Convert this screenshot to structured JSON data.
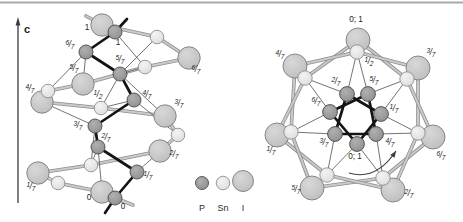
{
  "canvas": {
    "w": 463,
    "h": 222
  },
  "top_rule": {
    "y": 2.5,
    "color": "#a9a9a9",
    "width": 1.8
  },
  "axis": {
    "label": "c",
    "x": 18,
    "y_top": 24,
    "y_bottom": 203,
    "label_x": 24,
    "label_y": 33,
    "color": "#3a3a3a"
  },
  "atom_types": {
    "P": {
      "fill_light": "#b0b0b0",
      "fill_base": "#8e8e8e",
      "stroke": "#4a4a4a"
    },
    "Sn": {
      "fill_light": "#f3f3f3",
      "fill_base": "#dcdcdc",
      "stroke": "#8f8f8f"
    },
    "I": {
      "fill_light": "#d8d8d8",
      "fill_base": "#bdbdbd",
      "stroke": "#7d7d7d"
    }
  },
  "bond_styles": {
    "chain": {
      "under": "#8f8f8f",
      "under_w": 3.6,
      "over": "#cacaca",
      "over_w": 2.0
    },
    "thin": {
      "color": "#636363",
      "w": 0.9
    },
    "helix": {
      "color": "#141414",
      "w": 2.7
    }
  },
  "legend": {
    "label_y": 210.5,
    "entries": [
      {
        "type": "P",
        "label": "P",
        "x": 202,
        "y": 183,
        "r": 6.5
      },
      {
        "type": "Sn",
        "label": "Sn",
        "x": 223,
        "y": 183,
        "r": 6.8
      },
      {
        "type": "I",
        "label": "I",
        "x": 243,
        "y": 181,
        "r": 10.5
      }
    ]
  },
  "structures": [
    {
      "id": "helix-side-view",
      "atom_r": {
        "P": 7.0,
        "Sn": 6.8,
        "I": 11.2
      },
      "atoms": [
        {
          "id": "I1",
          "type": "I",
          "x": 102,
          "y": 25,
          "label": "1",
          "lx": 87,
          "ly": 30
        },
        {
          "id": "I67",
          "type": "I",
          "x": 189,
          "y": 58,
          "label": "6/7",
          "lx": 196,
          "ly": 72
        },
        {
          "id": "I57",
          "type": "I",
          "x": 83,
          "y": 84,
          "label": "5/7",
          "lx": 74,
          "ly": 71
        },
        {
          "id": "I47",
          "type": "I",
          "x": 42,
          "y": 102,
          "label": "4/7",
          "lx": 30,
          "ly": 91
        },
        {
          "id": "I37",
          "type": "I",
          "x": 165,
          "y": 116,
          "label": "3/7",
          "lx": 179,
          "ly": 106
        },
        {
          "id": "I27",
          "type": "I",
          "x": 160,
          "y": 151,
          "label": "2/7",
          "lx": 174,
          "ly": 157
        },
        {
          "id": "I17",
          "type": "I",
          "x": 38,
          "y": 173,
          "label": "1/7",
          "lx": 31,
          "ly": 189
        },
        {
          "id": "I0",
          "type": "I",
          "x": 102,
          "y": 192,
          "label": "0",
          "lx": 89,
          "ly": 200
        },
        {
          "id": "Sa",
          "type": "Sn",
          "x": 157,
          "y": 37
        },
        {
          "id": "Sb",
          "type": "Sn",
          "x": 145,
          "y": 67
        },
        {
          "id": "Sc",
          "type": "Sn",
          "x": 48,
          "y": 91
        },
        {
          "id": "Sh",
          "type": "Sn",
          "x": 101,
          "y": 108,
          "label": "1/2",
          "lx": 98,
          "ly": 97
        },
        {
          "id": "Sd",
          "type": "Sn",
          "x": 178,
          "y": 135
        },
        {
          "id": "Se",
          "type": "Sn",
          "x": 91,
          "y": 165
        },
        {
          "id": "Sf",
          "type": "Sn",
          "x": 58,
          "y": 183
        },
        {
          "id": "P1",
          "type": "P",
          "x": 115,
          "y": 32,
          "label": "1",
          "lx": 118,
          "ly": 45
        },
        {
          "id": "P67",
          "type": "P",
          "x": 86,
          "y": 52,
          "label": "6/7",
          "lx": 70,
          "ly": 47
        },
        {
          "id": "P57",
          "type": "P",
          "x": 120,
          "y": 74,
          "label": "5/7",
          "lx": 120,
          "ly": 62
        },
        {
          "id": "P47",
          "type": "P",
          "x": 134,
          "y": 100,
          "label": "4/7",
          "lx": 147,
          "ly": 97
        },
        {
          "id": "P37",
          "type": "P",
          "x": 95,
          "y": 126,
          "label": "3/7",
          "lx": 78,
          "ly": 128
        },
        {
          "id": "P27",
          "type": "P",
          "x": 98,
          "y": 147,
          "label": "2/7",
          "lx": 106,
          "ly": 140
        },
        {
          "id": "P17",
          "type": "P",
          "x": 137,
          "y": 172,
          "label": "1/7",
          "lx": 148,
          "ly": 178
        },
        {
          "id": "P0",
          "type": "P",
          "x": 115,
          "y": 198,
          "label": "0",
          "lx": 123,
          "ly": 209
        }
      ],
      "bonds": [
        {
          "kind": "chain",
          "a": "I1",
          "b": "Sa"
        },
        {
          "kind": "chain",
          "a": "Sa",
          "b": "I67"
        },
        {
          "kind": "chain",
          "a": "I67",
          "b": "Sb"
        },
        {
          "kind": "chain",
          "a": "Sb",
          "b": "I57"
        },
        {
          "kind": "chain",
          "a": "I57",
          "b": "Sc"
        },
        {
          "kind": "chain",
          "a": "Sc",
          "b": "I47"
        },
        {
          "kind": "chain",
          "a": "I47",
          "b": "Sh"
        },
        {
          "kind": "chain",
          "a": "Sh",
          "b": "I37"
        },
        {
          "kind": "chain",
          "a": "I37",
          "b": "Sd"
        },
        {
          "kind": "chain",
          "a": "Sd",
          "b": "I27"
        },
        {
          "kind": "chain",
          "a": "I27",
          "b": "Se"
        },
        {
          "kind": "chain",
          "a": "Se",
          "b": "I17"
        },
        {
          "kind": "chain",
          "a": "I17",
          "b": "Sf"
        },
        {
          "kind": "chain",
          "a": "Sf",
          "b": "I0"
        },
        {
          "kind": "thin",
          "a": "P1",
          "b": "Sb"
        },
        {
          "kind": "thin",
          "a": "Sa",
          "b": "P57"
        },
        {
          "kind": "thin",
          "a": "P67",
          "b": "Sc"
        },
        {
          "kind": "thin",
          "a": "P67",
          "b": "I57"
        },
        {
          "kind": "thin",
          "a": "P57",
          "b": "Sb"
        },
        {
          "kind": "thin",
          "a": "P57",
          "b": "Sh"
        },
        {
          "kind": "thin",
          "a": "P57",
          "b": "I37"
        },
        {
          "kind": "thin",
          "a": "P47",
          "b": "Sh"
        },
        {
          "kind": "thin",
          "a": "P47",
          "b": "Sd"
        },
        {
          "kind": "thin",
          "a": "P37",
          "b": "I47"
        },
        {
          "kind": "thin",
          "a": "P37",
          "b": "Se"
        },
        {
          "kind": "thin",
          "a": "P27",
          "b": "Se"
        },
        {
          "kind": "thin",
          "a": "P27",
          "b": "I0"
        },
        {
          "kind": "thin",
          "a": "P17",
          "b": "I27"
        },
        {
          "kind": "helix",
          "a": "P1",
          "b": "P67"
        },
        {
          "kind": "helix",
          "a": "P67",
          "b": "P57"
        },
        {
          "kind": "helix",
          "a": "P57",
          "b": "P47"
        },
        {
          "kind": "helix",
          "a": "P47",
          "b": "P37"
        },
        {
          "kind": "helix",
          "a": "P37",
          "b": "P27"
        },
        {
          "kind": "helix",
          "a": "P27",
          "b": "P17"
        },
        {
          "kind": "helix",
          "a": "P17",
          "b": "P0"
        }
      ],
      "stubs": [
        {
          "kind": "helix",
          "x1": 115,
          "y1": 32,
          "x2": 127,
          "y2": 19
        },
        {
          "kind": "helix",
          "x1": 115,
          "y1": 198,
          "x2": 105,
          "y2": 213
        },
        {
          "kind": "chain",
          "x1": 102,
          "y1": 25,
          "x2": 86,
          "y2": 16
        },
        {
          "kind": "chain",
          "x1": 115,
          "y1": 198,
          "x2": 133,
          "y2": 205
        }
      ]
    },
    {
      "id": "helix-projection",
      "atom_r": {
        "P": 7.4,
        "Sn": 7.2,
        "I": 12.0
      },
      "atoms": [
        {
          "id": "I01",
          "type": "I",
          "x": 358,
          "y": 40,
          "label": "0; 1",
          "lx": 356,
          "ly": 22
        },
        {
          "id": "I47",
          "type": "I",
          "x": 295,
          "y": 66,
          "label": "4/7",
          "lx": 280,
          "ly": 57
        },
        {
          "id": "I37",
          "type": "I",
          "x": 418,
          "y": 68,
          "label": "3/7",
          "lx": 431,
          "ly": 55
        },
        {
          "id": "I17",
          "type": "I",
          "x": 277,
          "y": 135,
          "label": "1/7",
          "lx": 271,
          "ly": 153
        },
        {
          "id": "I67",
          "type": "I",
          "x": 433,
          "y": 137,
          "label": "6/7",
          "lx": 441,
          "ly": 158
        },
        {
          "id": "I57",
          "type": "I",
          "x": 312,
          "y": 188,
          "label": "5/7",
          "lx": 296,
          "ly": 192
        },
        {
          "id": "I27",
          "type": "I",
          "x": 393,
          "y": 190,
          "label": "2/7",
          "lx": 409,
          "ly": 196
        },
        {
          "id": "S12",
          "type": "Sn",
          "x": 357,
          "y": 52,
          "label": "1/2",
          "lx": 369,
          "ly": 64
        },
        {
          "id": "Sul",
          "type": "Sn",
          "x": 305,
          "y": 78
        },
        {
          "id": "Sur",
          "type": "Sn",
          "x": 407,
          "y": 79
        },
        {
          "id": "Sl",
          "type": "Sn",
          "x": 291,
          "y": 132
        },
        {
          "id": "Sr",
          "type": "Sn",
          "x": 418,
          "y": 133
        },
        {
          "id": "Sbl",
          "type": "Sn",
          "x": 327,
          "y": 175
        },
        {
          "id": "Sbr",
          "type": "Sn",
          "x": 383,
          "y": 178
        },
        {
          "id": "P27",
          "type": "P",
          "x": 347,
          "y": 94,
          "label": "2/7",
          "lx": 336,
          "ly": 84
        },
        {
          "id": "P57",
          "type": "P",
          "x": 368,
          "y": 94,
          "label": "5/7",
          "lx": 374,
          "ly": 83
        },
        {
          "id": "P67",
          "type": "P",
          "x": 330,
          "y": 112,
          "label": "6/7",
          "lx": 316,
          "ly": 104
        },
        {
          "id": "P17",
          "type": "P",
          "x": 381,
          "y": 114,
          "label": "1/7",
          "lx": 394,
          "ly": 111
        },
        {
          "id": "P37",
          "type": "P",
          "x": 335,
          "y": 134,
          "label": "3/7",
          "lx": 324,
          "ly": 145
        },
        {
          "id": "P47",
          "type": "P",
          "x": 376,
          "y": 134,
          "label": "4/7",
          "lx": 390,
          "ly": 145
        },
        {
          "id": "P01",
          "type": "P",
          "x": 357,
          "y": 144,
          "label": "0; 1",
          "lx": 355,
          "ly": 159
        }
      ],
      "bonds": [
        {
          "kind": "chain",
          "a": "I01",
          "b": "Sul"
        },
        {
          "kind": "chain",
          "a": "I01",
          "b": "Sur"
        },
        {
          "kind": "chain",
          "a": "S12",
          "b": "I47"
        },
        {
          "kind": "chain",
          "a": "S12",
          "b": "I37"
        },
        {
          "kind": "chain",
          "a": "I47",
          "b": "Sl"
        },
        {
          "kind": "chain",
          "a": "Sul",
          "b": "I17"
        },
        {
          "kind": "chain",
          "a": "I37",
          "b": "Sr"
        },
        {
          "kind": "chain",
          "a": "Sur",
          "b": "I67"
        },
        {
          "kind": "chain",
          "a": "I17",
          "b": "Sbl"
        },
        {
          "kind": "chain",
          "a": "Sl",
          "b": "I57"
        },
        {
          "kind": "chain",
          "a": "I67",
          "b": "Sbr"
        },
        {
          "kind": "chain",
          "a": "Sr",
          "b": "I27"
        },
        {
          "kind": "chain",
          "a": "I57",
          "b": "Sbr"
        },
        {
          "kind": "chain",
          "a": "Sbl",
          "b": "I27"
        },
        {
          "kind": "thin",
          "a": "S12",
          "b": "P27"
        },
        {
          "kind": "thin",
          "a": "S12",
          "b": "P57"
        },
        {
          "kind": "thin",
          "a": "Sul",
          "b": "P67"
        },
        {
          "kind": "thin",
          "a": "Sul",
          "b": "P27"
        },
        {
          "kind": "thin",
          "a": "Sur",
          "b": "P57"
        },
        {
          "kind": "thin",
          "a": "Sur",
          "b": "P17"
        },
        {
          "kind": "thin",
          "a": "Sl",
          "b": "P67"
        },
        {
          "kind": "thin",
          "a": "Sl",
          "b": "P37"
        },
        {
          "kind": "thin",
          "a": "Sr",
          "b": "P17"
        },
        {
          "kind": "thin",
          "a": "Sr",
          "b": "P47"
        },
        {
          "kind": "thin",
          "a": "Sbl",
          "b": "P37"
        },
        {
          "kind": "thin",
          "a": "Sbl",
          "b": "P01"
        },
        {
          "kind": "thin",
          "a": "Sbr",
          "b": "P01"
        },
        {
          "kind": "thin",
          "a": "Sbr",
          "b": "P47"
        },
        {
          "kind": "helix",
          "a": "P01",
          "b": "P17"
        },
        {
          "kind": "helix",
          "a": "P17",
          "b": "P27"
        },
        {
          "kind": "helix",
          "a": "P27",
          "b": "P37"
        },
        {
          "kind": "helix",
          "a": "P37",
          "b": "P47"
        },
        {
          "kind": "helix",
          "a": "P47",
          "b": "P57"
        },
        {
          "kind": "helix",
          "a": "P57",
          "b": "P67"
        },
        {
          "kind": "helix",
          "a": "P67",
          "b": "P01"
        }
      ],
      "stubs": [],
      "rotation_arrow": {
        "path": "M 349 173 Q 376 181 396 151",
        "head": "396,151 394.6,157.8 390.2,155.0",
        "color": "#3f3f3f"
      }
    }
  ]
}
